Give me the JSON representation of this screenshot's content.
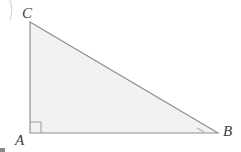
{
  "figure": {
    "type": "right-triangle-diagram",
    "width": 241,
    "height": 152,
    "background_color": "#ffffff",
    "stroke_color": "#8c8c8c",
    "stroke_width": 1.1,
    "fill_color": "#f2f2f2",
    "label_color": "#3c3c3c"
  },
  "labels": {
    "vertex_a": "A",
    "vertex_b": "B",
    "vertex_c": "C"
  },
  "geometry": {
    "points": {
      "a": {
        "x": 30,
        "y": 133
      },
      "b": {
        "x": 218,
        "y": 133
      },
      "c": {
        "x": 30,
        "y": 22
      }
    },
    "polygon_points": "30,22 30,133 218,133",
    "right_angle_marker": {
      "at": "A",
      "path": "M 41 133 L 41 122 L 30 122",
      "size": 11
    },
    "angle_tick": {
      "at": "B",
      "path": "M 197 128 L 204 132"
    }
  },
  "artifacts": {
    "corner_curve_path": "M 2 -10 Q 16 2 10 20",
    "corner_speck": {
      "x": 0,
      "y": 148,
      "width": 5,
      "height": 4
    }
  }
}
